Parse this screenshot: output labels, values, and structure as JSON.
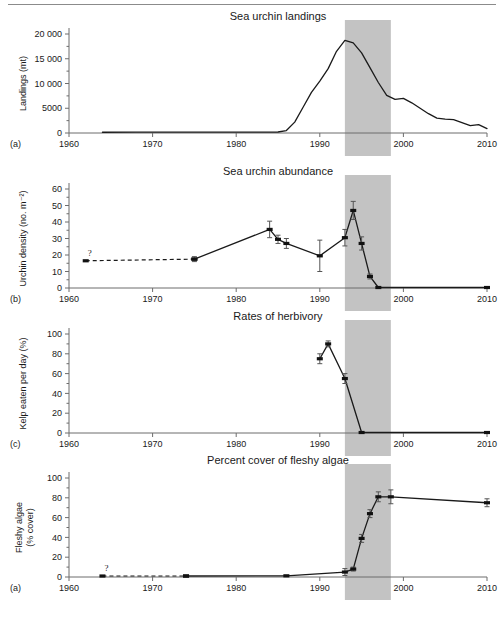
{
  "figure": {
    "background": "#ffffff",
    "shade_color": "#c3c3c3",
    "line_color": "#1a1a1a",
    "axis_color": "#6d6d6d",
    "shaded_period": {
      "start": 1993,
      "end": 1998.5
    },
    "uncertainty_marker": "?"
  },
  "chart_data": [
    {
      "type": "line",
      "panel_label": "(a)",
      "title": "Sea urchin landings",
      "ylabel": "Landings (mt)",
      "xlabel": "",
      "xlim": [
        1960,
        2010
      ],
      "ylim": [
        0,
        20000
      ],
      "grid": false,
      "legend": "none",
      "xticks": [
        1960,
        1970,
        1980,
        1990,
        2000,
        2010
      ],
      "xticklabels": [
        "1960",
        "1970",
        "1980",
        "1990",
        "2000",
        "2010"
      ],
      "yticks": [
        0,
        5000,
        10000,
        15000,
        20000
      ],
      "yticklabels": [
        "0",
        "5000",
        "10 000",
        "15 000",
        "20 000"
      ],
      "yminorticks": [
        2500,
        7500,
        12500,
        17500
      ],
      "series": [
        {
          "name": "Landings",
          "style": "solid",
          "x": [
            1964,
            1968,
            1972,
            1976,
            1980,
            1983,
            1985,
            1986,
            1987,
            1988,
            1989,
            1990,
            1991,
            1992,
            1993,
            1994,
            1995,
            1996,
            1997,
            1998,
            1999,
            2000,
            2001,
            2002,
            2003,
            2004,
            2005,
            2006,
            2007,
            2008,
            2009,
            2010
          ],
          "values": [
            150,
            160,
            170,
            170,
            170,
            180,
            200,
            500,
            2200,
            5200,
            8200,
            10500,
            13000,
            16500,
            18700,
            18200,
            16200,
            13200,
            10200,
            7600,
            6800,
            7000,
            6100,
            5000,
            3900,
            3000,
            2800,
            2700,
            2100,
            1500,
            1700,
            900
          ]
        }
      ]
    },
    {
      "type": "line",
      "panel_label": "(b)",
      "title": "Sea urchin abundance",
      "ylabel": "Urchin density (no. m⁻²)",
      "xlabel": "",
      "xlim": [
        1960,
        2010
      ],
      "ylim": [
        0,
        60
      ],
      "grid": false,
      "legend": "none",
      "xticks": [
        1960,
        1970,
        1980,
        1990,
        2000,
        2010
      ],
      "xticklabels": [
        "1960",
        "1970",
        "1980",
        "1990",
        "2000",
        "2010"
      ],
      "yticks": [
        0,
        10,
        20,
        30,
        40,
        50,
        60
      ],
      "yticklabels": [
        "0",
        "10",
        "20",
        "30",
        "40",
        "50",
        "60"
      ],
      "yminorticks": [
        5,
        15,
        25,
        35,
        45,
        55
      ],
      "series": [
        {
          "name": "Urchin density (inferred)",
          "style": "dashed",
          "x": [
            1962,
            1975
          ],
          "values": [
            16.5,
            17.5
          ],
          "errors": [
            null,
            null
          ]
        },
        {
          "name": "Urchin density (measured)",
          "style": "solid",
          "x": [
            1975,
            1984,
            1985,
            1986,
            1990,
            1993,
            1994,
            1995,
            1996,
            1997,
            2010
          ],
          "values": [
            17.5,
            35.5,
            29.5,
            27.0,
            19.5,
            30.5,
            47.0,
            27.0,
            7.0,
            0.3,
            0.3
          ],
          "errors": [
            1.5,
            5.0,
            2.5,
            3.0,
            9.5,
            5.0,
            5.5,
            4.0,
            1.5,
            0,
            0
          ]
        }
      ]
    },
    {
      "type": "line",
      "panel_label": "(c)",
      "title": "Rates of herbivory",
      "ylabel": "Kelp eaten per day (%)",
      "xlabel": "",
      "xlim": [
        1960,
        2010
      ],
      "ylim": [
        0,
        100
      ],
      "grid": false,
      "legend": "none",
      "xticks": [
        1960,
        1970,
        1980,
        1990,
        2000,
        2010
      ],
      "xticklabels": [
        "1960",
        "1970",
        "1980",
        "1990",
        "2000",
        "2010"
      ],
      "yticks": [
        0,
        20,
        40,
        60,
        80,
        100
      ],
      "yticklabels": [
        "0",
        "20",
        "40",
        "60",
        "80",
        "100"
      ],
      "yminorticks": [
        10,
        30,
        50,
        70,
        90
      ],
      "series": [
        {
          "name": "Kelp eaten per day",
          "style": "solid",
          "x": [
            1990,
            1991,
            1993,
            1995,
            2010
          ],
          "values": [
            75,
            90,
            55,
            0.5,
            0.5
          ],
          "errors": [
            5,
            3,
            5,
            0,
            0
          ]
        }
      ]
    },
    {
      "type": "line",
      "panel_label": "(a)",
      "title": "Percent cover of fleshy algae",
      "ylabel": "Fleshy algae\n(% cover)",
      "ylabel_line1": "Fleshy algae",
      "ylabel_line2": "(% cover)",
      "xlabel": "",
      "xlim": [
        1960,
        2010
      ],
      "ylim": [
        0,
        100
      ],
      "grid": false,
      "legend": "none",
      "xticks": [
        1960,
        1970,
        1980,
        1990,
        2000,
        2010
      ],
      "xticklabels": [
        "1960",
        "1970",
        "1980",
        "1990",
        "2000",
        "2010"
      ],
      "yticks": [
        0,
        20,
        40,
        60,
        80,
        100
      ],
      "yticklabels": [
        "0",
        "20",
        "40",
        "60",
        "80",
        "100"
      ],
      "yminorticks": [
        10,
        30,
        50,
        70,
        90
      ],
      "series": [
        {
          "name": "Fleshy algae cover (inferred)",
          "style": "dashed",
          "x": [
            1964,
            1974
          ],
          "values": [
            1.0,
            1.0
          ],
          "errors": [
            null,
            null
          ]
        },
        {
          "name": "Fleshy algae cover (measured)",
          "style": "solid",
          "x": [
            1974,
            1986,
            1993,
            1994,
            1995,
            1996,
            1997,
            1998.5,
            2010
          ],
          "values": [
            1.0,
            1.2,
            5.0,
            8.0,
            39.0,
            64.0,
            81.0,
            81.0,
            75.0
          ],
          "errors": [
            0,
            0,
            3.5,
            2.0,
            4.0,
            4.0,
            5.0,
            7.0,
            4.0
          ]
        }
      ]
    }
  ]
}
